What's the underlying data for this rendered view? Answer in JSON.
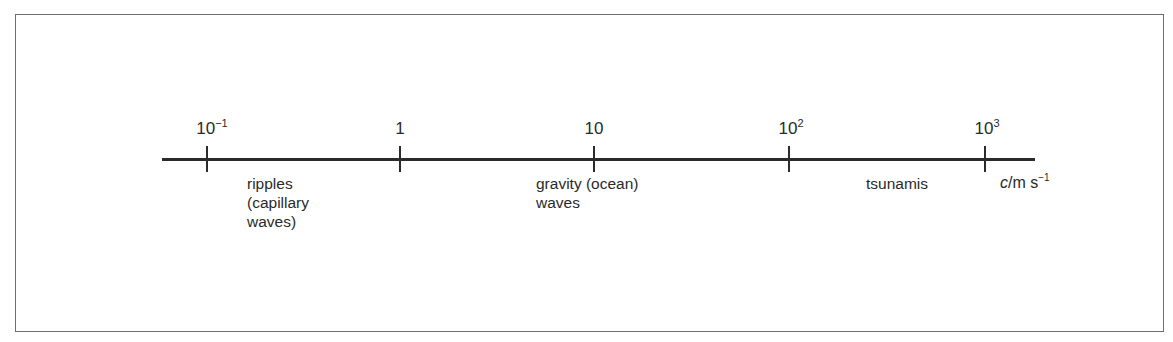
{
  "diagram": {
    "type": "logarithmic number line",
    "ticks": [
      {
        "base": "10",
        "exp": "−1",
        "x": 207
      },
      {
        "base": "1",
        "exp": "",
        "x": 400
      },
      {
        "base": "10",
        "exp": "",
        "x": 594
      },
      {
        "base": "10",
        "exp": "2",
        "x": 789
      },
      {
        "base": "10",
        "exp": "3",
        "x": 985
      }
    ],
    "regions": [
      {
        "label": "ripples\n(capillary\nwaves)"
      },
      {
        "label": "gravity (ocean)\nwaves"
      },
      {
        "label": "tsunamis"
      }
    ],
    "unit": {
      "symbol": "c",
      "rest": "/m s",
      "exp": "−1"
    }
  }
}
